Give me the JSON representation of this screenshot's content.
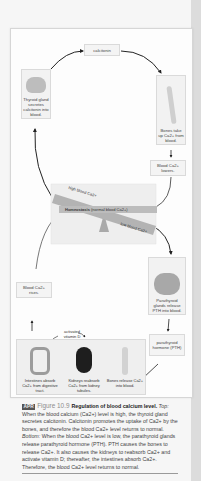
{
  "figure": {
    "center_label": "calcitonin",
    "thyroid_box": "Thyroid gland secretes calcitonin into blood.",
    "bones_uptake_box": "Bones take up Ca2+ from blood.",
    "blood_lowers_box": "Blood Ca2+ lowers.",
    "homeostasis": {
      "high_label": "high blood Ca2+",
      "center_bold": "Homeostasis",
      "center_rest": " (normal blood Ca2+)",
      "low_label": "low blood Ca2+"
    },
    "blood_rises_box": "Blood Ca2+ rises.",
    "parathyroid_box": "Parathyroid glands release PTH into blood.",
    "pth_box": "parathyroid hormone (PTH)",
    "activated_label": "activated vitamin D",
    "bottom_items": [
      {
        "label": "Intestines absorb Ca2+ from digestive tract."
      },
      {
        "label": "Kidneys reabsorb Ca2+ from kidney tubules."
      },
      {
        "label": "Bones release Ca2+ into blood."
      }
    ]
  },
  "caption": {
    "badge": "APR",
    "figure_number": "Figure 10.9",
    "title": "Regulation of blood calcium level.",
    "top_label": "Top:",
    "top_text": " When the blood calcium (Ca2+) level is high, the thyroid gland secretes calcitonin. Calcitonin promotes the uptake of Ca2+ by the bones, and therefore the blood Ca2+ level returns to normal. ",
    "bottom_label": "Bottom:",
    "bottom_text": " When the blood Ca2+ level is low, the parathyroid glands release parathyroid hormone (PTH). PTH causes the bones to release Ca2+. It also causes the kidneys to reabsorb Ca2+ and activate vitamin D; thereafter, the intestines absorb Ca2+. Therefore, the blood Ca2+ level returns to normal."
  },
  "colors": {
    "seesaw_bar": "#b0b0b0",
    "fulcrum": "#a9a9a9",
    "panel_bg": "#eeeeee",
    "badge_bg": "#555555"
  }
}
